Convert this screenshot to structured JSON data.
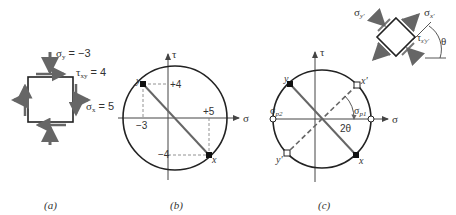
{
  "panels": {
    "a": {
      "caption": "(a)",
      "sigma_y_label": "σ",
      "sigma_y_sub": "y",
      "sigma_y_value": " = −3",
      "tau_label": "τ",
      "tau_sub": "xy",
      "tau_value": " = 4",
      "sigma_x_label": "σ",
      "sigma_x_sub": "x",
      "sigma_x_value": " = 5"
    },
    "b": {
      "caption": "(b)",
      "axis_tau": "τ",
      "axis_sigma": "σ",
      "tick_plus4": "+4",
      "tick_minus3": "−3",
      "tick_plus5": "+5",
      "tick_minus4": "−4",
      "point_y": "y",
      "point_x": "x"
    },
    "c": {
      "caption": "(c)",
      "axis_tau": "τ",
      "axis_sigma": "σ",
      "point_y": "y",
      "point_x": "x",
      "point_xp": "x′",
      "point_yp": "y′",
      "sigma_p1": "σ",
      "sigma_p1_sub": "p1",
      "sigma_p2": "σ",
      "sigma_p2_sub": "p2",
      "angle_2theta": "2θ",
      "element": {
        "sigma_yp": "σ",
        "sigma_yp_sub": "y′",
        "sigma_xp": "σ",
        "sigma_xp_sub": "x′",
        "tau_xpyp": "τ",
        "tau_xpyp_sub": "x′y′",
        "theta": "θ"
      }
    }
  },
  "colors": {
    "line": "#222222",
    "arrow": "#666666",
    "dashed": "#777777"
  }
}
